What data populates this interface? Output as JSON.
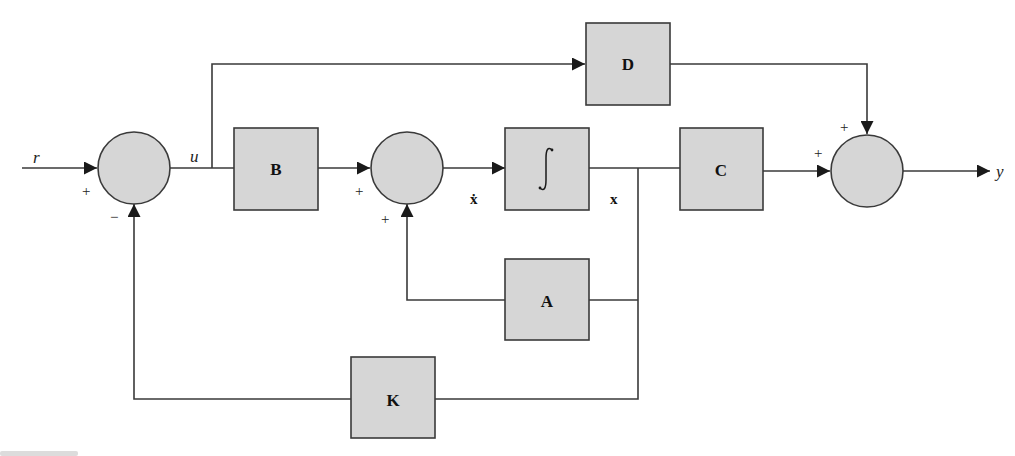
{
  "diagram": {
    "type": "state-space block diagram with state feedback",
    "colors": {
      "block_fill": "#d6d6d6",
      "stroke": "#3a3a3a",
      "background": "#ffffff"
    },
    "blocks": {
      "B": {
        "label": "B"
      },
      "D": {
        "label": "D"
      },
      "integrator": {
        "label": "∫"
      },
      "C": {
        "label": "C"
      },
      "A": {
        "label": "A"
      },
      "K": {
        "label": "K"
      }
    },
    "signals": {
      "input": "r",
      "control": "u",
      "state_derivative": "ẋ",
      "state": "x",
      "output": "y"
    },
    "summing_junctions": [
      {
        "id": "sum1",
        "signs": {
          "left": "+",
          "bottom": "−"
        }
      },
      {
        "id": "sum2",
        "signs": {
          "left": "+",
          "bottom": "+"
        }
      },
      {
        "id": "sum3",
        "signs": {
          "left": "+",
          "top": "+"
        }
      }
    ],
    "connections": [
      "r → sum1 (+)",
      "sum1 → u",
      "u → B",
      "u → D",
      "B → sum2 (+)",
      "sum2 → ẋ → integrator",
      "integrator → x",
      "x → C",
      "x → A → sum2 (+)",
      "x → K → sum1 (−)",
      "C → sum3 (+)",
      "D → sum3 (+)",
      "sum3 → y"
    ]
  }
}
